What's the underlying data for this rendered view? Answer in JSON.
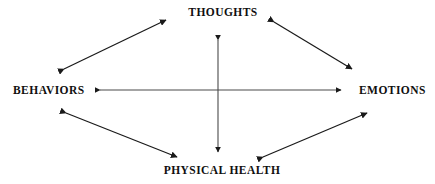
{
  "diagram": {
    "background_color": "#ffffff",
    "stroke_color": "#1a1a1a",
    "text_color": "#100f0f",
    "nodes": [
      {
        "id": "thoughts",
        "label": "THOUGHTS",
        "position": "top"
      },
      {
        "id": "behaviors",
        "label": "BEHAVIORS",
        "position": "left"
      },
      {
        "id": "emotions",
        "label": "EMOTIONS",
        "position": "right"
      },
      {
        "id": "physical_health",
        "label": "PHYSICAL HEALTH",
        "position": "bottom"
      }
    ],
    "connectors": [
      {
        "id": "behaviors-thoughts",
        "from": "behaviors",
        "to": "thoughts",
        "style": "double-headed-arrow",
        "orientation": "diagonal"
      },
      {
        "id": "thoughts-emotions",
        "from": "thoughts",
        "to": "emotions",
        "style": "double-headed-arrow",
        "orientation": "diagonal"
      },
      {
        "id": "behaviors-physical-health",
        "from": "behaviors",
        "to": "physical_health",
        "style": "double-headed-arrow",
        "orientation": "diagonal"
      },
      {
        "id": "physical-health-emotions",
        "from": "physical_health",
        "to": "emotions",
        "style": "double-headed-arrow",
        "orientation": "diagonal"
      },
      {
        "id": "behaviors-emotions",
        "from": "behaviors",
        "to": "emotions",
        "style": "double-headed-arrow",
        "orientation": "horizontal"
      },
      {
        "id": "thoughts-physical-health",
        "from": "thoughts",
        "to": "physical_health",
        "style": "double-headed-arrow",
        "orientation": "vertical"
      }
    ]
  }
}
